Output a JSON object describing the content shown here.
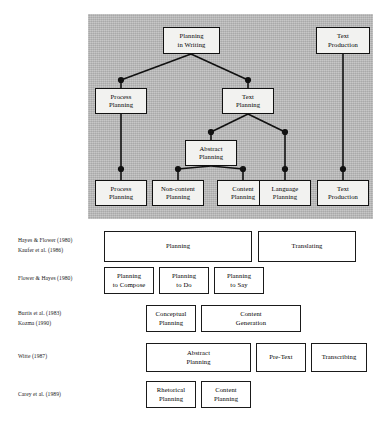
{
  "figure": {
    "diagram": {
      "name": "planning-taxonomy-tree",
      "nodes": {
        "planning_in_writing": "Planning\nin Writing",
        "text_production_top": "Text\nProduction",
        "process_planning_mid": "Process\nPlanning",
        "text_planning_mid": "Text\nPlanning",
        "abstract_planning": "Abstract\nPlanning",
        "process_planning_leaf": "Process\nPlanning",
        "non_content_planning_leaf": "Non-content\nPlanning",
        "content_planning_leaf": "Content\nPlanning",
        "language_planning_leaf": "Language\nPlanning",
        "text_production_leaf": "Text\nProduction"
      }
    },
    "comparison_rows": [
      {
        "id": "row-hayes-flower-kaufer",
        "citation": "Hayes & Flower (1980)\nKaufer et al. (1986)",
        "boxes": [
          {
            "label": "Planning"
          },
          {
            "label": "Translating"
          }
        ]
      },
      {
        "id": "row-flower-hayes",
        "citation": "Flower & Hayes (1980)",
        "boxes": [
          {
            "label": "Planning\nto Compose"
          },
          {
            "label": "Planning\nto Do"
          },
          {
            "label": "Planning\nto Say"
          }
        ]
      },
      {
        "id": "row-burtis-kozma",
        "citation": "Burtis et al. (1983)\nKozma (1990)",
        "boxes": [
          {
            "label": "Conceptual\nPlanning"
          },
          {
            "label": "Content\nGeneration"
          }
        ]
      },
      {
        "id": "row-witte",
        "citation": "Witte (1987)",
        "boxes": [
          {
            "label": "Abstract\nPlanning"
          },
          {
            "label": "Pre-Text"
          },
          {
            "label": "Transcribing"
          }
        ]
      },
      {
        "id": "row-carey",
        "citation": "Carey et al. (1989)",
        "boxes": [
          {
            "label": "Rhetorical\nPlanning"
          },
          {
            "label": "Content\nPlanning"
          }
        ]
      }
    ]
  }
}
